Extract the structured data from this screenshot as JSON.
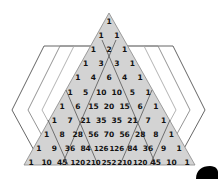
{
  "diagram": {
    "rows": [
      [
        1
      ],
      [
        1,
        1
      ],
      [
        1,
        2,
        1
      ],
      [
        1,
        3,
        3,
        1
      ],
      [
        1,
        4,
        6,
        4,
        1
      ],
      [
        1,
        5,
        10,
        10,
        5,
        1
      ],
      [
        1,
        6,
        15,
        20,
        15,
        6,
        1
      ],
      [
        1,
        7,
        21,
        35,
        35,
        21,
        7,
        1
      ],
      [
        1,
        8,
        28,
        56,
        70,
        56,
        28,
        8,
        1
      ],
      [
        1,
        9,
        36,
        84,
        126,
        126,
        84,
        36,
        9,
        1
      ],
      [
        1,
        10,
        45,
        120,
        210,
        252,
        210,
        120,
        45,
        10,
        1
      ]
    ],
    "colors": {
      "triangle_fill": "#d3d3d3",
      "triangle_stroke": "#888888",
      "hex_stroke_outer": "#555555",
      "hex_stroke_mid": "#888888",
      "hex_stroke_inner": "#aaaaaa",
      "diagonal_stroke": "#444444",
      "blob": "#000000"
    }
  }
}
